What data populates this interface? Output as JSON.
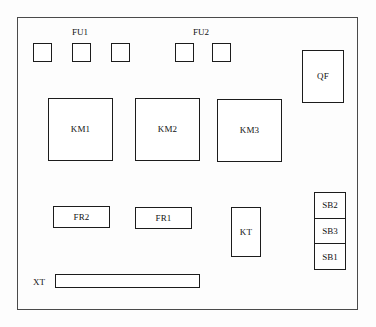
{
  "diagram": {
    "enclosure_label": "control-cabinet-outline"
  },
  "fuse_groups": [
    {
      "label": "FU1",
      "name": "fuse-group-label-fu1"
    },
    {
      "label": "FU2",
      "name": "fuse-group-label-fu2"
    }
  ],
  "fuses": [
    {
      "id": "fuse-1"
    },
    {
      "id": "fuse-2"
    },
    {
      "id": "fuse-3"
    },
    {
      "id": "fuse-4"
    },
    {
      "id": "fuse-5"
    }
  ],
  "breaker": {
    "label": "QF"
  },
  "contactors": [
    {
      "label": "KM1"
    },
    {
      "label": "KM2"
    },
    {
      "label": "KM3"
    }
  ],
  "relays": [
    {
      "label": "FR2"
    },
    {
      "label": "FR1"
    }
  ],
  "timer": {
    "label": "KT"
  },
  "buttons": [
    {
      "label": "SB2"
    },
    {
      "label": "SB3"
    },
    {
      "label": "SB1"
    }
  ],
  "terminal_block": {
    "label": "XT"
  },
  "colors": {
    "component_outline": "#1c1c1c",
    "enclosure_outline": "#4a4a4a",
    "background": "#fdfdfd",
    "text": "#111111"
  }
}
